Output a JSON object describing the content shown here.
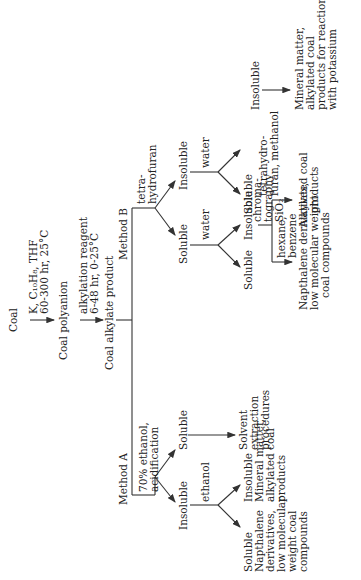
{
  "diagram": {
    "start": "Coal",
    "step1_reagents": [
      "K, C₁₀H₈, THF",
      "60-300 hr, 25°C"
    ],
    "intermediate": "Coal polyanion",
    "step2_reagents": [
      "alkylation reagent",
      "6-48 hr, 0-25°C"
    ],
    "product": "Coal alkylate product",
    "method_a": {
      "label": "Method A",
      "treatment": [
        "70% ethanol,",
        "acidification"
      ],
      "soluble": "Soluble",
      "soluble_next": [
        "Solvent",
        "extraction",
        "procedures"
      ],
      "insoluble": "Insoluble",
      "insoluble_solvent": "ethanol",
      "ethanol_soluble": [
        "Soluble",
        "Napthalene",
        "derivatives,",
        "low molecular",
        "weight coal",
        "compounds"
      ],
      "ethanol_insoluble": [
        "Insoluble",
        "Mineral matter,",
        "alkylated coal",
        "products"
      ]
    },
    "method_b": {
      "label": "Method B",
      "treatment": [
        "tetra-",
        "hydrofuran"
      ],
      "soluble": "Soluble",
      "soluble_solvent": "water",
      "soluble_water_soluble": "Soluble",
      "soluble_water_insoluble": "Insoluble",
      "chromatography": [
        "chroma-",
        "tography",
        "SiO₂"
      ],
      "eluent_1": [
        "hexane,",
        "benzene"
      ],
      "eluent_1_product": [
        "Napthalene derivatives,",
        "low molecular weight",
        "coal compounds"
      ],
      "eluent_2": [
        "tetrahydro-",
        "furan, methanol"
      ],
      "eluent_2_product": [
        "Alkylated coal",
        "products"
      ],
      "insoluble": "Insoluble",
      "insoluble_solvent": "water",
      "insoluble_water_soluble": "Soluble",
      "insoluble_water_insoluble": "Insoluble",
      "final_product": [
        "Mineral matter,",
        "alkylated coal",
        "products for reaction",
        "with potassium"
      ]
    }
  }
}
